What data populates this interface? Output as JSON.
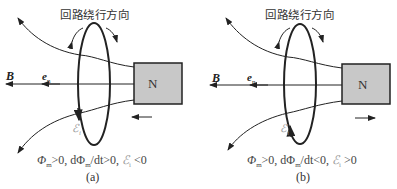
{
  "panels": [
    {
      "id": "a",
      "title": "回路绕行方向",
      "labels": {
        "B": "B",
        "en": "e",
        "en_sub": "n",
        "magnet": "N",
        "emf": "ℰ",
        "emf_sub": "i"
      },
      "formula": {
        "phi": "Φ",
        "phi_sub": "m",
        "part1": ">0, dΦ",
        "part2_sub": "m",
        "part3": "/dt>0, ",
        "emf": "ℰ",
        "emf_sub": "i",
        "part4": " <0"
      },
      "caption": "(a)",
      "magnet_motion": "toward-loop",
      "emf_direction": "down-left-side"
    },
    {
      "id": "b",
      "title": "回路绕行方向",
      "labels": {
        "B": "B",
        "en": "e",
        "en_sub": "n",
        "magnet": "N",
        "emf": "ℰ",
        "emf_sub": "i"
      },
      "formula": {
        "phi": "Φ",
        "phi_sub": "m",
        "part1": ">0, dΦ",
        "part2_sub": "m",
        "part3": "/dt<0, ",
        "emf": "ℰ",
        "emf_sub": "i",
        "part4": " >0"
      },
      "caption": "(b)",
      "magnet_motion": "away-from-loop",
      "emf_direction": "up-left-side"
    }
  ],
  "colors": {
    "line": "#222222",
    "magnet_fill": "#c8c8c8",
    "emf_label": "#999999"
  }
}
